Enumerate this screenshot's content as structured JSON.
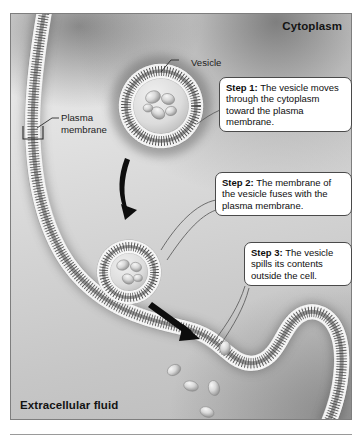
{
  "diagram": {
    "corner_labels": {
      "cytoplasm": "Cytoplasm",
      "extracellular_fluid": "Extracellular fluid"
    },
    "structure_labels": {
      "vesicle": "Vesicle",
      "plasma_membrane_line1": "Plasma",
      "plasma_membrane_line2": "membrane"
    },
    "steps": [
      {
        "label": "Step 1:",
        "text": " The vesicle moves through the cytoplasm toward the plasma membrane."
      },
      {
        "label": "Step 2:",
        "text": " The membrane of the vesicle fuses with the plasma membrane."
      },
      {
        "label": "Step 3:",
        "text": " The vesicle spills its contents outside the cell."
      }
    ],
    "colors": {
      "membrane_dark": "#3a3a3a",
      "membrane_head": "#f2f2f2",
      "arrow": "#0d0d0d",
      "callout_border": "#4a4a4a",
      "panel_border": "#7e7e7e",
      "text": "#131313"
    }
  }
}
